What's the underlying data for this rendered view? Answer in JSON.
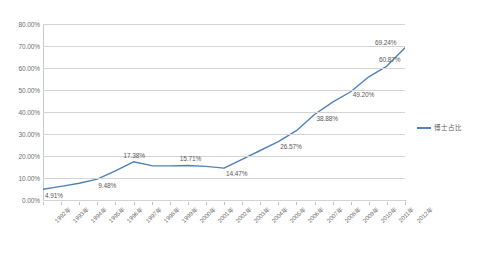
{
  "chart_data": {
    "type": "line",
    "title": "",
    "xlabel": "",
    "ylabel": "",
    "ylim": [
      0,
      80
    ],
    "ytick_labels": [
      "0.00%",
      "10.00%",
      "20.00%",
      "30.00%",
      "40.00%",
      "50.00%",
      "60.00%",
      "70.00%",
      "80.00%"
    ],
    "ytick_values": [
      0,
      10,
      20,
      30,
      40,
      50,
      60,
      70,
      80
    ],
    "grid": true,
    "legend_position": "right",
    "categories": [
      "1992年",
      "1993年",
      "1994年",
      "1995年",
      "1996年",
      "1997年",
      "1998年",
      "1999年",
      "2000年",
      "2001年",
      "2002年",
      "2003年",
      "2004年",
      "2005年",
      "2006年",
      "2007年",
      "2008年",
      "2009年",
      "2010年",
      "2011年",
      "2012年"
    ],
    "series": [
      {
        "name": "博士占比",
        "color": "#4f81bd",
        "values": [
          4.91,
          6.2,
          7.6,
          9.48,
          13.2,
          17.38,
          15.6,
          15.5,
          15.71,
          15.3,
          14.47,
          18.5,
          22.5,
          26.57,
          31.5,
          38.88,
          44.5,
          49.2,
          56.0,
          60.87,
          69.24
        ]
      }
    ],
    "point_labels": [
      {
        "index": 0,
        "text": "4.91%"
      },
      {
        "index": 3,
        "text": "9.48%"
      },
      {
        "index": 5,
        "text": "17.38%"
      },
      {
        "index": 8,
        "text": "15.71%"
      },
      {
        "index": 10,
        "text": "14.47%"
      },
      {
        "index": 13,
        "text": "26.57%"
      },
      {
        "index": 15,
        "text": "38.88%"
      },
      {
        "index": 17,
        "text": "49.20%"
      },
      {
        "index": 19,
        "text": "60.87%"
      },
      {
        "index": 20,
        "text": "69.24%"
      }
    ]
  },
  "legend": {
    "series_label": "博士占比"
  },
  "colors": {
    "line": "#4f81bd",
    "gridline": "#d4d4d4",
    "text": "#595959",
    "background": "#ffffff"
  }
}
